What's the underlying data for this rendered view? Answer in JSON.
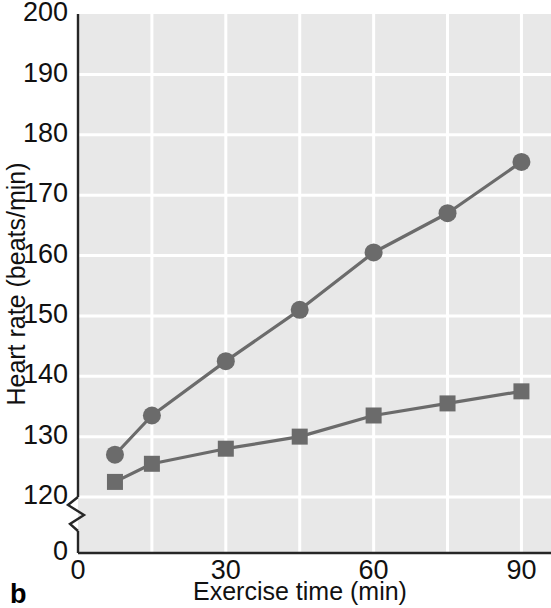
{
  "panel": {
    "label": "b"
  },
  "chart_data": {
    "type": "line",
    "title": "",
    "xlabel": "Exercise time (min)",
    "ylabel": "Heart rate (beats/min)",
    "x": [
      7.5,
      15,
      30,
      45,
      60,
      75,
      90
    ],
    "series": [
      {
        "name": "circle-series",
        "marker": "circle",
        "color": "#6b6b6b",
        "values": [
          127,
          133.5,
          142.5,
          151,
          160.5,
          167,
          175.5
        ]
      },
      {
        "name": "square-series",
        "marker": "square",
        "color": "#6b6b6b",
        "values": [
          122.5,
          125.5,
          128,
          130,
          133.5,
          135.5,
          137.5
        ]
      }
    ],
    "xlim": [
      0,
      96
    ],
    "ylim": [
      120,
      200
    ],
    "xticks": [
      0,
      30,
      60,
      90
    ],
    "xtick_labels": [
      "0",
      "30",
      "60",
      "90"
    ],
    "yticks": [
      120,
      130,
      140,
      150,
      160,
      170,
      180,
      190,
      200
    ],
    "ytick_labels": [
      "120",
      "130",
      "140",
      "150",
      "160",
      "170",
      "180",
      "190",
      "200"
    ],
    "y_axis_break": true,
    "y_origin_label": "0",
    "grid": true,
    "grid_color": "#ffffff",
    "plot_bg": "#e8e8e8",
    "legend": "none"
  },
  "colors": {
    "plot_background": "#e8e8e8",
    "gridline": "#ffffff",
    "axis": "#262626",
    "data": "#6b6b6b",
    "text": "#111111"
  }
}
